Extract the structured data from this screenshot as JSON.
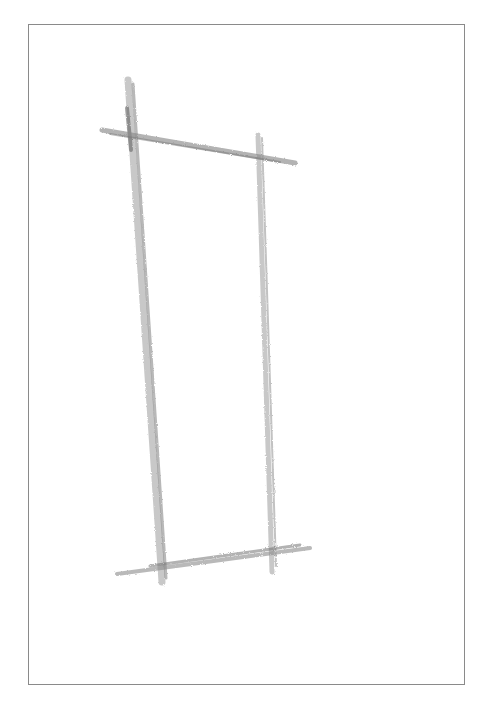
{
  "image": {
    "description": "Pencil sketch of a tall narrow rectangle with overshooting construction lines inside a thin border",
    "stroke_color": "#8c8c8c",
    "dark_stroke_color": "#6e6e6e",
    "frame_color": "#8a8a8a",
    "background": "#ffffff"
  },
  "lines": {
    "top_bar": {
      "x1": 102,
      "y1": 130,
      "x2": 295,
      "y2": 163
    },
    "left_post": {
      "x1": 128,
      "y1": 80,
      "x2": 162,
      "y2": 582
    },
    "left_post_b": {
      "x1": 133,
      "y1": 84,
      "x2": 166,
      "y2": 578
    },
    "right_post": {
      "x1": 258,
      "y1": 135,
      "x2": 272,
      "y2": 572
    },
    "right_post_b": {
      "x1": 262,
      "y1": 138,
      "x2": 276,
      "y2": 566
    },
    "bottom_bar": {
      "x1": 117,
      "y1": 574,
      "x2": 310,
      "y2": 548
    },
    "bottom_bar_b": {
      "x1": 130,
      "y1": 568,
      "x2": 300,
      "y2": 545
    }
  }
}
